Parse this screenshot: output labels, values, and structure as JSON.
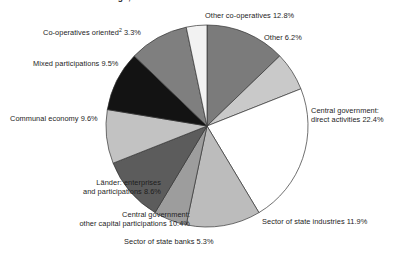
{
  "chart_data": {
    "type": "pie",
    "title": "ATS/EUR billion of borrowings; share of GDP in %",
    "xlabel": "",
    "ylabel": "",
    "legend_position": "none",
    "grid": false,
    "units": "percent",
    "start_angle_deg": 0,
    "direction": "clockwise",
    "categories": [
      "Other co-operatives",
      "Other",
      "Central government: direct activities",
      "Sector of state industries",
      "Sector of state banks",
      "Central government: other capital participations",
      "Länder: enterprises and participations",
      "Communal economy",
      "Mixed participations",
      "Co-operatives oriented"
    ],
    "values": [
      12.8,
      6.2,
      22.4,
      11.9,
      5.3,
      10.4,
      8.6,
      9.6,
      9.5,
      3.3
    ],
    "colors": [
      "#7b7b7b",
      "#c9c9c9",
      "#ffffff",
      "#bcbcbc",
      "#9d9d9d",
      "#5c5c5c",
      "#c2c2c2",
      "#131313",
      "#7f7f7f",
      "#f2f2f2"
    ],
    "slice_outline_color": "#333333",
    "slices": [
      {
        "label": "Other co-operatives",
        "value": 12.8,
        "color": "#7b7b7b"
      },
      {
        "label": "Other",
        "value": 6.2,
        "color": "#c9c9c9"
      },
      {
        "label": "Central government: direct activities",
        "value": 22.4,
        "color": "#ffffff"
      },
      {
        "label": "Sector of state industries",
        "value": 11.9,
        "color": "#bcbcbc"
      },
      {
        "label": "Sector of state banks",
        "value": 5.3,
        "color": "#9d9d9d"
      },
      {
        "label": "Central government: other capital participations",
        "value": 10.4,
        "color": "#5c5c5c"
      },
      {
        "label": "Länder: enterprises and participations",
        "value": 8.6,
        "color": "#c2c2c2"
      },
      {
        "label": "Communal economy",
        "value": 9.6,
        "color": "#131313"
      },
      {
        "label": "Mixed participations",
        "value": 9.5,
        "color": "#7f7f7f"
      },
      {
        "label": "Co-operatives oriented",
        "value": 3.3,
        "color": "#f2f2f2"
      }
    ]
  },
  "title": {
    "text": "ATS/EUR billion of borrowings; share of GDP in %"
  },
  "labels": {
    "other_coops": "Other co-operatives 12.8%",
    "other": "Other 6.2%",
    "central_gov_direct_line1": "Central government:",
    "central_gov_direct_line2": "direct activities 22.4%",
    "state_industries": "Sector of state industries 11.9%",
    "state_banks": "Sector of state banks 5.3%",
    "central_gov_other_line1": "Central government:",
    "central_gov_other_line2": "other capital participations 10.4%",
    "laender_line1": "Länder: enterprises",
    "laender_line2": "and participations 8.6%",
    "communal_economy": "Communal economy 9.6%",
    "mixed_participations": "Mixed participations 9.5%",
    "coops_oriented_pre": "Co-operatives oriented",
    "coops_oriented_sup": "2",
    "coops_oriented_post": " 3.3%"
  }
}
